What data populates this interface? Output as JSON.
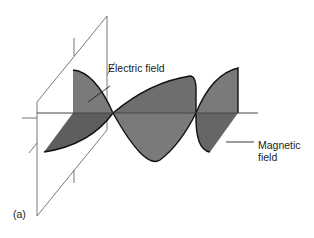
{
  "figure": {
    "panel_label": "(a)",
    "labels": {
      "electric_field": "Electric field",
      "magnetic_field_line1": "Magnetic",
      "magnetic_field_line2": "field"
    },
    "colors": {
      "wave_fill": "#7a7a7a",
      "wave_fill_dark": "#5e5e5e",
      "wave_outline": "#111111",
      "plane_line": "#666666",
      "axis_line": "#555555",
      "background": "#ffffff"
    }
  }
}
